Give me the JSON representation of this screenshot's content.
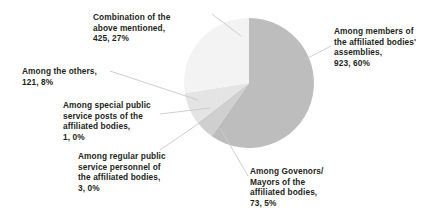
{
  "chart_data": {
    "type": "pie",
    "title": "",
    "subtitle": "",
    "xlabel": "",
    "ylabel": "",
    "legend_position": "none",
    "grid": false,
    "total": 1546,
    "start_angle_deg": 0,
    "direction": "clockwise",
    "categories": [
      "Among members of the affiliated bodies' assemblies",
      "Among Govenors/ Mayors of the affiliated bodies",
      "Among regular public service personnel of the affiliated bodies",
      "Among special public service posts of the affiliated bodies",
      "Among the others",
      "Combination of the above mentioned"
    ],
    "values": [
      923,
      73,
      3,
      1,
      121,
      425
    ],
    "percents": [
      60,
      5,
      0,
      0,
      8,
      27
    ],
    "colors": [
      "#bdbdbd",
      "#cfcfcf",
      "#d6d6d6",
      "#dcdcdc",
      "#e4e4e4",
      "#f3f3f3"
    ],
    "slices": [
      {
        "name": "Among members of the affiliated bodies' assemblies",
        "value": 923,
        "percent": 60,
        "color": "#bdbdbd",
        "label_lines": [
          "Among members of",
          "the affiliated bodies'",
          "assemblies,",
          "923, 60%"
        ]
      },
      {
        "name": "Among Govenors/ Mayors of the affiliated bodies",
        "value": 73,
        "percent": 5,
        "color": "#cfcfcf",
        "label_lines": [
          "Among Govenors/",
          "Mayors of the",
          "affiliated bodies,",
          "73, 5%"
        ]
      },
      {
        "name": "Among regular public service personnel of the affiliated bodies",
        "value": 3,
        "percent": 0,
        "color": "#d6d6d6",
        "label_lines": [
          "Among regular public",
          "service personnel of",
          "the affiliated bodies,",
          "3, 0%"
        ]
      },
      {
        "name": "Among special public service posts of the affiliated bodies",
        "value": 1,
        "percent": 0,
        "color": "#dcdcdc",
        "label_lines": [
          "Among special public",
          "service posts of the",
          "affiliated bodies,",
          "1, 0%"
        ]
      },
      {
        "name": "Among the others",
        "value": 121,
        "percent": 8,
        "color": "#e4e4e4",
        "label_lines": [
          "Among the others,",
          "121, 8%"
        ]
      },
      {
        "name": "Combination of the above mentioned",
        "value": 425,
        "percent": 27,
        "color": "#f3f3f3",
        "label_lines": [
          "Combination of the",
          "above mentioned,",
          "425, 27%"
        ]
      }
    ]
  },
  "labels": {
    "members": "Among members of\nthe affiliated bodies'\nassemblies,\n923, 60%",
    "governors": "Among Govenors/\nMayors of the\naffiliated bodies,\n73, 5%",
    "regular": "Among regular public\nservice personnel of\nthe affiliated bodies,\n3, 0%",
    "special": "Among special public\nservice posts of the\naffiliated bodies,\n1, 0%",
    "others": "Among the others,\n121, 8%",
    "combination": "Combination of the\nabove mentioned,\n425, 27%"
  },
  "style": {
    "background": "#ffffff",
    "text_color": "#231f20",
    "leader_line_color": "#c9c9c9"
  }
}
